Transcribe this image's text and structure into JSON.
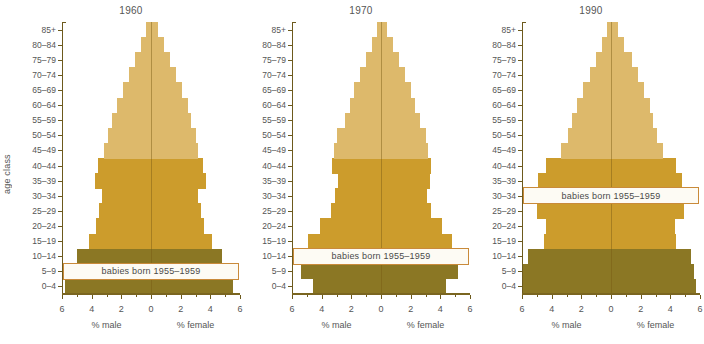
{
  "figure": {
    "y_axis_label": "age class",
    "x_label_male": "% male",
    "x_label_female": "% female",
    "annotation": "babies born 1955–1959",
    "age_classes": [
      "0–4",
      "5–9",
      "10–14",
      "15–19",
      "20–24",
      "25–29",
      "30–34",
      "35–39",
      "40–44",
      "45–49",
      "50–54",
      "55–59",
      "60–64",
      "65–69",
      "70–74",
      "75–79",
      "80–84",
      "85+"
    ],
    "x_ticks": [
      "6",
      "4",
      "2",
      "0",
      "2",
      "4",
      "6"
    ],
    "colors": {
      "band_light": "#ddb96b",
      "band_mid": "#cc9c2c",
      "band_dark": "#8b7724",
      "axis": "#6d5a1d",
      "annotation_border": "#c98a3a",
      "text": "#555555",
      "background": "#ffffff"
    }
  },
  "chart_data": {
    "type": "bar",
    "xlabel": "% male / % female",
    "ylabel": "age class",
    "xlim": [
      6,
      6
    ],
    "grid": false,
    "legend": "none",
    "categories": [
      "0–4",
      "5–9",
      "10–14",
      "15–19",
      "20–24",
      "25–29",
      "30–34",
      "35–39",
      "40–44",
      "45–49",
      "50–54",
      "55–59",
      "60–64",
      "65–69",
      "70–74",
      "75–79",
      "80–84",
      "85+"
    ],
    "panels": [
      {
        "year": "1960",
        "cohort_band_index": 1,
        "annotation": "babies born 1955–1959",
        "male": [
          5.8,
          5.4,
          5.0,
          4.2,
          3.7,
          3.5,
          3.3,
          3.8,
          3.6,
          3.2,
          2.9,
          2.6,
          2.3,
          1.9,
          1.5,
          1.1,
          0.7,
          0.35
        ],
        "female": [
          5.5,
          5.2,
          4.8,
          4.1,
          3.6,
          3.4,
          3.2,
          3.7,
          3.5,
          3.2,
          3.0,
          2.7,
          2.5,
          2.1,
          1.7,
          1.3,
          0.9,
          0.45
        ]
      },
      {
        "year": "1970",
        "cohort_band_index": 2,
        "annotation": "babies born 1955–1959",
        "male": [
          4.6,
          5.4,
          5.4,
          4.9,
          4.1,
          3.4,
          3.1,
          2.9,
          3.3,
          3.2,
          3.0,
          2.4,
          2.1,
          1.8,
          1.4,
          1.0,
          0.6,
          0.3
        ],
        "female": [
          4.4,
          5.2,
          5.3,
          4.8,
          4.1,
          3.4,
          3.1,
          3.3,
          3.4,
          3.2,
          3.0,
          2.6,
          2.3,
          2.0,
          1.6,
          1.2,
          0.8,
          0.4
        ]
      },
      {
        "year": "1990",
        "cohort_band_index": 6,
        "annotation": "babies born 1955–1959",
        "male": [
          5.9,
          5.9,
          5.6,
          4.5,
          4.4,
          5.0,
          5.1,
          4.9,
          4.4,
          3.4,
          2.9,
          2.6,
          2.3,
          1.9,
          1.4,
          1.0,
          0.6,
          0.3
        ],
        "female": [
          5.7,
          5.6,
          5.4,
          4.4,
          4.3,
          4.9,
          5.0,
          4.8,
          4.4,
          3.5,
          3.1,
          2.8,
          2.6,
          2.2,
          1.8,
          1.4,
          0.9,
          0.45
        ]
      }
    ]
  }
}
